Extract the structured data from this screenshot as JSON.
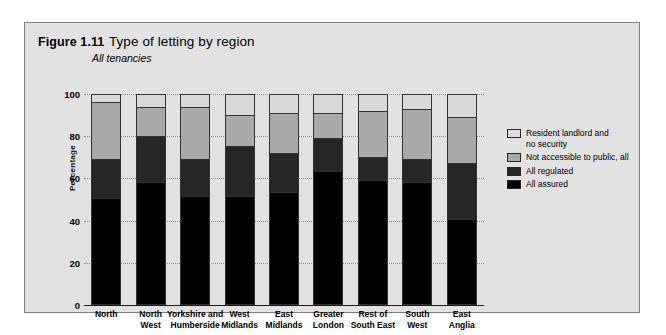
{
  "figure": {
    "number": "Figure 1.11",
    "title": "Type of letting by region",
    "subtitle": "All tenancies"
  },
  "chart_data": {
    "type": "bar",
    "stacked": true,
    "title": "Type of letting by region",
    "subtitle": "All tenancies",
    "xlabel": "",
    "ylabel": "Percentage",
    "ylim": [
      0,
      100
    ],
    "yticks": [
      0,
      20,
      40,
      60,
      80,
      100
    ],
    "grid": true,
    "legend_position": "right",
    "categories": [
      "North",
      "North West",
      "Yorkshire and Humberside",
      "West Midlands",
      "East Midlands",
      "Greater London",
      "Rest of South East",
      "South West",
      "East Anglia"
    ],
    "series": [
      {
        "name": "All assured",
        "color": "#000000",
        "values": [
          50,
          58,
          51,
          51,
          53,
          63,
          59,
          58,
          40
        ]
      },
      {
        "name": "All regulated",
        "color": "#262626",
        "values": [
          19,
          22,
          18,
          24,
          19,
          16,
          11,
          11,
          27
        ]
      },
      {
        "name": "Not accessible to public, all",
        "color": "#a9a9a9",
        "values": [
          27,
          14,
          25,
          15,
          19,
          12,
          22,
          24,
          22
        ]
      },
      {
        "name": "Resident landlord and no security",
        "color": "#d9d9d9",
        "values": [
          4,
          6,
          6,
          10,
          9,
          9,
          8,
          7,
          11
        ]
      }
    ]
  },
  "axis": {
    "y_title": "Percentage",
    "y_ticks": [
      "100",
      "80",
      "60",
      "40",
      "20",
      "0"
    ]
  },
  "legend": {
    "items": [
      {
        "label_line1": "Resident landlord and",
        "label_line2": "no security",
        "swatch": "resident-landlord-swatch"
      },
      {
        "label_line1": "Not accessible to public, all",
        "label_line2": "",
        "swatch": "not-accessible-swatch"
      },
      {
        "label_line1": "All regulated",
        "label_line2": "",
        "swatch": "all-regulated-swatch"
      },
      {
        "label_line1": "All assured",
        "label_line2": "",
        "swatch": "all-assured-swatch"
      }
    ]
  },
  "x_labels": [
    {
      "line1": "North",
      "line2": ""
    },
    {
      "line1": "North",
      "line2": "West"
    },
    {
      "line1": "Yorkshire and",
      "line2": "Humberside"
    },
    {
      "line1": "West",
      "line2": "Midlands"
    },
    {
      "line1": "East",
      "line2": "Midlands"
    },
    {
      "line1": "Greater",
      "line2": "London"
    },
    {
      "line1": "Rest of",
      "line2": "South East"
    },
    {
      "line1": "South",
      "line2": "West"
    },
    {
      "line1": "East",
      "line2": "Anglia"
    }
  ]
}
